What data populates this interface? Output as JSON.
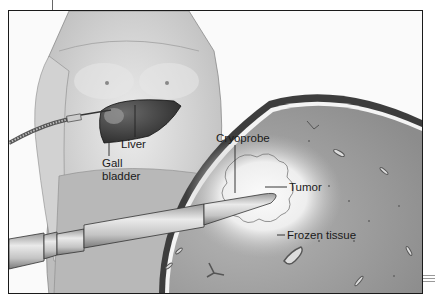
{
  "figure": {
    "type": "medical-illustration",
    "labels": {
      "liver": "Liver",
      "gallbladder_line1": "Gall",
      "gallbladder_line2": "bladder",
      "cryoprobe": "Cryoprobe",
      "tumor": "Tumor",
      "frozen_tissue": "Frozen tissue"
    },
    "colors": {
      "frame_border": "#1a1a1a",
      "tissue": "#9a9a9a",
      "frozen_zone": "#f2f2f2",
      "liver": "#3a3a3a",
      "skin": "#d8d8d8",
      "probe": "#c8c8c8"
    }
  }
}
